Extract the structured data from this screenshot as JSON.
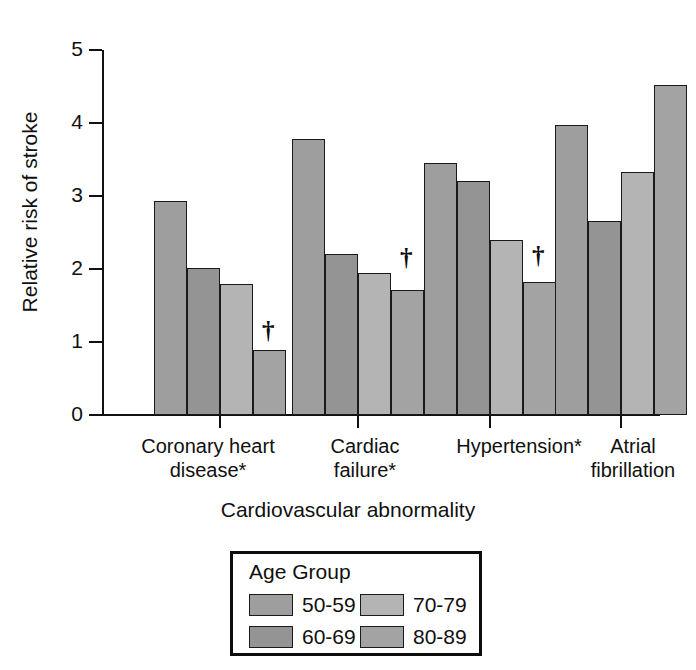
{
  "chart_data": {
    "type": "bar",
    "title": "",
    "xlabel": "Cardiovascular abnormality",
    "ylabel": "Relative risk of stroke",
    "ylim": [
      0,
      5
    ],
    "yticks": [
      "0",
      "1",
      "2",
      "3",
      "4",
      "5"
    ],
    "grid": false,
    "legend_position": "below-plot",
    "legend_title": "Age Group",
    "categories": [
      "Coronary heart disease*",
      "Cardiac failure*",
      "Hypertension*",
      "Atrial fibrillation"
    ],
    "category_lines": [
      [
        "Coronary heart",
        "disease*"
      ],
      [
        "Cardiac",
        "failure*"
      ],
      [
        "Hypertension*",
        ""
      ],
      [
        "Atrial",
        "fibrillation"
      ]
    ],
    "series": [
      {
        "name": "50-59",
        "color": "#9e9e9e",
        "values": [
          2.93,
          3.78,
          3.45,
          3.97
        ]
      },
      {
        "name": "60-69",
        "color": "#949494",
        "values": [
          2.01,
          2.2,
          3.2,
          2.66
        ]
      },
      {
        "name": "70-79",
        "color": "#b4b4b4",
        "values": [
          1.8,
          1.94,
          2.4,
          3.33
        ]
      },
      {
        "name": "80-89",
        "color": "#a3a3a3",
        "values": [
          0.89,
          1.71,
          1.82,
          4.52
        ]
      }
    ],
    "annotations": [
      {
        "symbol": "†",
        "group": "Coronary heart disease*",
        "series": "80-89"
      },
      {
        "symbol": "†",
        "group": "Cardiac failure*",
        "series": "80-89"
      },
      {
        "symbol": "†",
        "group": "Hypertension*",
        "series": "80-89"
      }
    ]
  },
  "legend": {
    "title": "Age Group",
    "entries": [
      {
        "label": "50-59",
        "color": "#9e9e9e"
      },
      {
        "label": "70-79",
        "color": "#b4b4b4"
      },
      {
        "label": "60-69",
        "color": "#949494"
      },
      {
        "label": "80-89",
        "color": "#a3a3a3"
      }
    ]
  },
  "axes": {
    "y_title": "Relative risk of stroke",
    "x_title": "Cardiovascular abnormality",
    "y_ticks": [
      "5",
      "4",
      "3",
      "2",
      "1",
      "0"
    ]
  }
}
